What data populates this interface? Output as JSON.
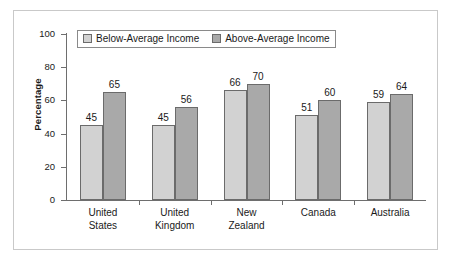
{
  "chart_data": {
    "type": "bar",
    "title": "",
    "xlabel": "",
    "ylabel": "Percentage",
    "ylim": [
      0,
      100
    ],
    "yticks": [
      0,
      20,
      40,
      60,
      80,
      100
    ],
    "grid": false,
    "legend_position": "top-left-inside",
    "categories": [
      {
        "line1": "United",
        "line2": "States"
      },
      {
        "line1": "United",
        "line2": "Kingdom"
      },
      {
        "line1": "New",
        "line2": "Zealand"
      },
      {
        "line1": "Canada",
        "line2": ""
      },
      {
        "line1": "Australia",
        "line2": ""
      }
    ],
    "series": [
      {
        "name": "Below-Average Income",
        "color": "#d2d2d2",
        "values": [
          45,
          45,
          66,
          51,
          59
        ]
      },
      {
        "name": "Above-Average Income",
        "color": "#a9a9a9",
        "values": [
          65,
          56,
          70,
          60,
          64
        ]
      }
    ]
  },
  "legend": {
    "items": [
      {
        "label": "Below-Average Income"
      },
      {
        "label": "Above-Average Income"
      }
    ]
  },
  "axis": {
    "y_title": "Percentage",
    "y_tick_labels": [
      "100",
      "80",
      "60",
      "40",
      "20",
      "0"
    ]
  }
}
